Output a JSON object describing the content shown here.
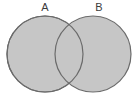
{
  "figure": {
    "type": "venn-diagram",
    "title": "",
    "width": 139,
    "height": 98,
    "background_color": "#ffffff"
  },
  "chart_data": {
    "type": "diagram",
    "subtype": "venn",
    "sets": [
      {
        "id": "A",
        "label": "A",
        "label_x": 45,
        "label_y": 8,
        "center_x": 45,
        "center_y": 54,
        "radius": 38,
        "fill": "#c6c6c6",
        "stroke": "#6b6b6b"
      },
      {
        "id": "B",
        "label": "B",
        "label_x": 99,
        "label_y": 8,
        "center_x": 93,
        "center_y": 54,
        "radius": 38,
        "fill": "#c6c6c6",
        "stroke": "#6b6b6b"
      }
    ],
    "intersection": {
      "shaded": true,
      "fill": "#c6c6c6",
      "label": ""
    },
    "stroke_width": 1.2,
    "legend": [],
    "annotations": []
  },
  "colors": {
    "circle_fill": "#c6c6c6",
    "circle_stroke": "#6b6b6b",
    "label_text": "#3c3c3c",
    "background": "#ffffff"
  }
}
